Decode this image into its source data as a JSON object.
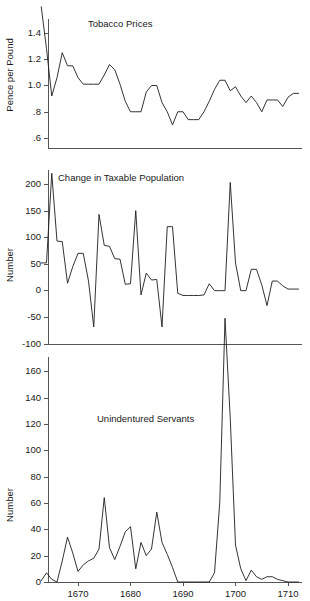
{
  "figure": {
    "width": 310,
    "height": 601,
    "background": "#ffffff",
    "line_color": "#1d1d1d",
    "axis_color": "#555555"
  },
  "chart_data": [
    {
      "type": "line",
      "title": "Tobacco Prices",
      "xlabel": "",
      "ylabel": "Pence per Pound",
      "grid": false,
      "legend": "none",
      "xlim": [
        1663,
        1712
      ],
      "ylim": [
        0.55,
        1.62
      ],
      "ytick_labels": [
        "1.4",
        "1.2",
        "1.0",
        ".8",
        ".6"
      ],
      "ytick_values": [
        1.4,
        1.2,
        1.0,
        0.8,
        0.6
      ],
      "xtick_labels": [
        "1670",
        "1680",
        "1690",
        "1700",
        "1710"
      ],
      "xtick_values": [
        1670,
        1680,
        1690,
        1700,
        1710
      ],
      "x": [
        1663,
        1664,
        1665,
        1666,
        1667,
        1668,
        1669,
        1670,
        1671,
        1672,
        1673,
        1674,
        1675,
        1676,
        1677,
        1678,
        1679,
        1680,
        1681,
        1682,
        1683,
        1684,
        1685,
        1686,
        1687,
        1688,
        1689,
        1690,
        1691,
        1692,
        1693,
        1694,
        1695,
        1696,
        1697,
        1698,
        1699,
        1700,
        1701,
        1702,
        1703,
        1704,
        1705,
        1706,
        1707,
        1708,
        1709,
        1710,
        1711,
        1712
      ],
      "values": [
        1.6,
        1.28,
        0.92,
        1.06,
        1.25,
        1.15,
        1.15,
        1.06,
        1.01,
        1.01,
        1.01,
        1.01,
        1.08,
        1.16,
        1.12,
        1.01,
        0.88,
        0.8,
        0.8,
        0.8,
        0.95,
        1.0,
        1.0,
        0.87,
        0.8,
        0.7,
        0.8,
        0.8,
        0.74,
        0.74,
        0.74,
        0.8,
        0.88,
        0.97,
        1.04,
        1.04,
        0.96,
        0.99,
        0.92,
        0.87,
        0.92,
        0.87,
        0.8,
        0.89,
        0.89,
        0.89,
        0.84,
        0.91,
        0.94,
        0.94
      ]
    },
    {
      "type": "line",
      "title": "Change in Taxable Population",
      "xlabel": "",
      "ylabel": "Number",
      "grid": false,
      "legend": "none",
      "xlim": [
        1663,
        1712
      ],
      "ylim": [
        -100,
        225
      ],
      "ytick_labels": [
        "200",
        "150",
        "100",
        "50",
        "0",
        "-50",
        "-100"
      ],
      "ytick_values": [
        200,
        150,
        100,
        50,
        0,
        -50,
        -100
      ],
      "xtick_labels": [
        "1670",
        "1680",
        "1690",
        "1700",
        "1710"
      ],
      "xtick_values": [
        1670,
        1680,
        1690,
        1700,
        1710
      ],
      "x": [
        1663,
        1664,
        1665,
        1666,
        1667,
        1668,
        1669,
        1670,
        1671,
        1672,
        1673,
        1674,
        1675,
        1676,
        1677,
        1678,
        1679,
        1680,
        1681,
        1682,
        1683,
        1684,
        1685,
        1686,
        1687,
        1688,
        1689,
        1690,
        1691,
        1692,
        1693,
        1694,
        1695,
        1696,
        1697,
        1698,
        1699,
        1700,
        1701,
        1702,
        1703,
        1704,
        1705,
        1706,
        1707,
        1708,
        1709,
        1710,
        1711,
        1712
      ],
      "values": [
        52,
        52,
        220,
        93,
        92,
        14,
        45,
        70,
        70,
        18,
        -68,
        143,
        85,
        83,
        60,
        59,
        12,
        13,
        150,
        -8,
        33,
        20,
        21,
        -68,
        120,
        120,
        -5,
        -9,
        -9,
        -9,
        -9,
        -8,
        13,
        0,
        0,
        0,
        203,
        52,
        0,
        0,
        40,
        40,
        11,
        -28,
        18,
        18,
        9,
        3,
        3,
        3
      ]
    },
    {
      "type": "line",
      "title": "Unindentured Servants",
      "xlabel": "",
      "ylabel": "Number",
      "grid": false,
      "legend": "none",
      "xlim": [
        1663,
        1712
      ],
      "ylim": [
        0,
        170
      ],
      "ytick_labels": [
        "160",
        "140",
        "120",
        "100",
        "80",
        "60",
        "40",
        "20",
        "0"
      ],
      "ytick_values": [
        160,
        140,
        120,
        100,
        80,
        60,
        40,
        20,
        0
      ],
      "xtick_labels": [
        "1670",
        "1680",
        "1690",
        "1700",
        "1710"
      ],
      "xtick_values": [
        1670,
        1680,
        1690,
        1700,
        1710
      ],
      "x": [
        1663,
        1664,
        1665,
        1666,
        1667,
        1668,
        1669,
        1670,
        1671,
        1672,
        1673,
        1674,
        1675,
        1676,
        1677,
        1678,
        1679,
        1680,
        1681,
        1682,
        1683,
        1684,
        1685,
        1686,
        1687,
        1688,
        1689,
        1690,
        1691,
        1692,
        1693,
        1694,
        1695,
        1696,
        1697,
        1698,
        1699,
        1700,
        1701,
        1702,
        1703,
        1704,
        1705,
        1706,
        1707,
        1708,
        1709,
        1710,
        1711,
        1712
      ],
      "values": [
        1,
        7,
        2,
        0,
        16,
        34,
        22,
        8,
        13,
        16,
        18,
        25,
        64,
        26,
        17,
        27,
        38,
        42,
        10,
        30,
        20,
        25,
        53,
        30,
        21,
        11,
        0,
        0,
        0,
        0,
        0,
        0,
        0,
        7,
        60,
        200,
        124,
        28,
        10,
        1,
        9,
        4,
        2,
        4,
        4,
        2,
        1,
        0,
        0,
        0
      ]
    }
  ]
}
